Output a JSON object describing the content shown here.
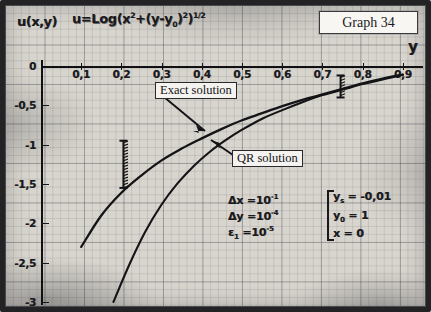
{
  "title_box": {
    "label": "Graph 34"
  },
  "axes": {
    "y_axis_label": "u(x,y)",
    "x_axis_label": "y",
    "formula_text": "u=Log(x²+(y-y₀)²)^½"
  },
  "annotations": {
    "exact_solution_label": "Exact solution",
    "qr_solution_label": "QR solution",
    "params": [
      {
        "symbol": "Δx",
        "eq": "=",
        "value": "10",
        "exp": "-1"
      },
      {
        "symbol": "Δy",
        "eq": "=",
        "value": "10",
        "exp": "-4"
      },
      {
        "symbol": "ε",
        "sub": "1",
        "eq": "=",
        "value": "10",
        "exp": "-5"
      }
    ],
    "boundary_conditions": [
      {
        "symbol": "y",
        "sub": "s",
        "eq": "= -0,01"
      },
      {
        "symbol": "y",
        "sub": "0",
        "eq": "= 1"
      },
      {
        "symbol": "x",
        "sub": "",
        "eq": "= 0"
      }
    ]
  },
  "chart_data": {
    "type": "line",
    "title": "Graph 34",
    "xlabel": "y",
    "ylabel": "u(x,y)",
    "xlim": [
      0,
      0.95
    ],
    "ylim": [
      -3,
      0.18
    ],
    "grid": true,
    "legend": [
      "Exact solution",
      "QR solution"
    ],
    "xticks": [
      "0,1",
      "0,2",
      "0,3",
      "0,4",
      "0,5",
      "0,6",
      "0,7",
      "0,8",
      "0,9"
    ],
    "xtick_values": [
      0.1,
      0.2,
      0.3,
      0.4,
      0.5,
      0.6,
      0.7,
      0.8,
      0.9
    ],
    "yticks": [
      "0",
      "-0,5",
      "-1",
      "-1,5",
      "-2",
      "-2,5",
      "-3"
    ],
    "ytick_values": [
      0,
      -0.5,
      -1,
      -1.5,
      -2,
      -2.5,
      -3
    ],
    "series": [
      {
        "name": "Exact solution",
        "x": [
          0.1,
          0.15,
          0.2,
          0.25,
          0.3,
          0.35,
          0.4,
          0.45,
          0.5,
          0.55,
          0.6,
          0.65,
          0.7,
          0.75,
          0.8,
          0.85,
          0.9
        ],
        "y": [
          -2.3,
          -1.9,
          -1.61,
          -1.39,
          -1.2,
          -1.05,
          -0.92,
          -0.8,
          -0.69,
          -0.6,
          -0.51,
          -0.43,
          -0.36,
          -0.29,
          -0.22,
          -0.16,
          -0.11
        ]
      },
      {
        "name": "QR solution",
        "x": [
          0.18,
          0.22,
          0.26,
          0.3,
          0.34,
          0.38,
          0.42,
          0.46,
          0.5,
          0.55,
          0.6,
          0.65,
          0.7,
          0.75,
          0.8,
          0.85,
          0.9
        ],
        "y": [
          -3.0,
          -2.52,
          -2.1,
          -1.76,
          -1.49,
          -1.27,
          -1.09,
          -0.94,
          -0.81,
          -0.67,
          -0.56,
          -0.46,
          -0.37,
          -0.3,
          -0.23,
          -0.17,
          -0.11
        ]
      }
    ],
    "error_bars": [
      {
        "x": 0.205,
        "y_top": -0.95,
        "y_bottom": -1.55,
        "note": "hatched-error-bar"
      },
      {
        "x": 0.745,
        "y_top": -0.12,
        "y_bottom": -0.4,
        "note": "hatched-error-bar"
      }
    ]
  }
}
